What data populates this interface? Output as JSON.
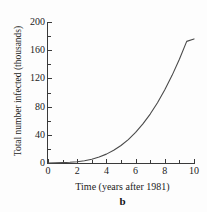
{
  "chart_data": {
    "type": "line",
    "title": "",
    "subtitle": "",
    "xlabel": "Time (years after 1981)",
    "ylabel": "Total number infected (thousands)",
    "caption": "b",
    "xlim": [
      0,
      10
    ],
    "ylim": [
      0,
      200
    ],
    "grid": false,
    "legend": null,
    "x_ticks": [
      0,
      2,
      4,
      6,
      8,
      10
    ],
    "x_tick_labels": [
      "0",
      "2",
      "4",
      "6",
      "8",
      "10"
    ],
    "x_minor_ticks": [
      1,
      3,
      5,
      7,
      9
    ],
    "y_ticks": [
      0,
      40,
      80,
      120,
      160,
      200
    ],
    "y_tick_labels": [
      "0",
      "40",
      "80",
      "120",
      "160",
      "200"
    ],
    "y_minor_ticks": [
      20,
      60,
      100,
      140,
      180
    ],
    "series": [
      {
        "name": "Total number infected",
        "color": "#4a4a4a",
        "x": [
          0,
          0.5,
          1,
          1.5,
          2,
          2.5,
          3,
          3.5,
          4,
          4.5,
          5,
          5.5,
          6,
          6.5,
          7,
          7.5,
          8,
          8.5,
          9,
          9.5,
          10
        ],
        "y": [
          0,
          0.2,
          0.5,
          1.0,
          1.8,
          3.2,
          5.4,
          8.5,
          12.6,
          18.0,
          24.8,
          33.2,
          43.4,
          55.4,
          69.4,
          85.5,
          103.8,
          124.3,
          147.2,
          172.5,
          176.0
        ]
      }
    ]
  },
  "axes": {
    "y_title": "Total number infected (thousands)",
    "x_title": "Time (years after 1981)"
  },
  "caption": {
    "label": "b"
  }
}
